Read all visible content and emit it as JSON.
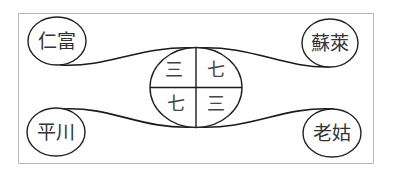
{
  "diagram": {
    "type": "relationship-diagram",
    "frame": {
      "stroke": "#b8b8b8"
    },
    "nodes": {
      "top_left": "仁富",
      "top_right": "蘇萊",
      "bottom_left": "平川",
      "bottom_right": "老姑"
    },
    "center": {
      "quadrants": {
        "top_left": "三",
        "top_right": "七",
        "bottom_left": "七",
        "bottom_right": "三"
      }
    },
    "colors": {
      "line": "#1a1a1a",
      "text": "#333333"
    }
  }
}
